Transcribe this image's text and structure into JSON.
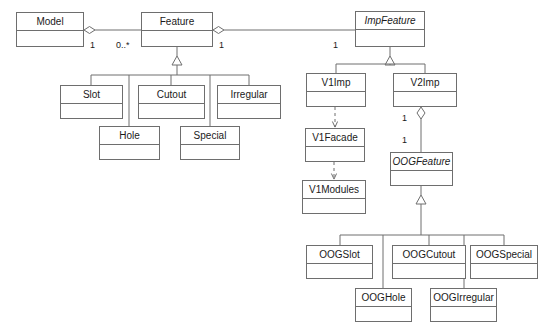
{
  "diagram": {
    "type": "uml-class-diagram",
    "background_color": "#ffffff",
    "line_color": "#6e6e6e",
    "text_color": "#1a1a1a",
    "classes": [
      {
        "id": "model",
        "name": "Model",
        "abstract": false,
        "x": 16,
        "y": 12,
        "w": 68,
        "h": 35
      },
      {
        "id": "feature",
        "name": "Feature",
        "abstract": false,
        "x": 141,
        "y": 12,
        "w": 72,
        "h": 35
      },
      {
        "id": "impfeature",
        "name": "ImpFeature",
        "abstract": true,
        "x": 355,
        "y": 11,
        "w": 70,
        "h": 36
      },
      {
        "id": "slot",
        "name": "Slot",
        "abstract": false,
        "x": 60,
        "y": 85,
        "w": 63,
        "h": 34
      },
      {
        "id": "cutout",
        "name": "Cutout",
        "abstract": false,
        "x": 138,
        "y": 85,
        "w": 67,
        "h": 34
      },
      {
        "id": "irregular",
        "name": "Irregular",
        "abstract": false,
        "x": 217,
        "y": 85,
        "w": 64,
        "h": 34
      },
      {
        "id": "hole",
        "name": "Hole",
        "abstract": false,
        "x": 99,
        "y": 126,
        "w": 61,
        "h": 34
      },
      {
        "id": "special",
        "name": "Special",
        "abstract": false,
        "x": 180,
        "y": 126,
        "w": 60,
        "h": 34
      },
      {
        "id": "v1imp",
        "name": "V1Imp",
        "abstract": false,
        "x": 306,
        "y": 73,
        "w": 60,
        "h": 34
      },
      {
        "id": "v2imp",
        "name": "V2Imp",
        "abstract": false,
        "x": 393,
        "y": 73,
        "w": 64,
        "h": 34
      },
      {
        "id": "v1facade",
        "name": "V1Facade",
        "abstract": false,
        "x": 305,
        "y": 128,
        "w": 60,
        "h": 34
      },
      {
        "id": "v1modules",
        "name": "V1Modules",
        "abstract": false,
        "x": 302,
        "y": 180,
        "w": 64,
        "h": 34
      },
      {
        "id": "oogfeature",
        "name": "OOGFeature",
        "abstract": true,
        "x": 390,
        "y": 152,
        "w": 63,
        "h": 34
      },
      {
        "id": "oogslot",
        "name": "OOGSlot",
        "abstract": false,
        "x": 306,
        "y": 245,
        "w": 67,
        "h": 34
      },
      {
        "id": "oogcutout",
        "name": "OOGCutout",
        "abstract": false,
        "x": 392,
        "y": 245,
        "w": 74,
        "h": 34
      },
      {
        "id": "oogspecial",
        "name": "OOGSpecial",
        "abstract": false,
        "x": 470,
        "y": 245,
        "w": 68,
        "h": 34
      },
      {
        "id": "oophole",
        "name": "OOGHole",
        "abstract": false,
        "x": 355,
        "y": 288,
        "w": 57,
        "h": 34
      },
      {
        "id": "oogirregular",
        "name": "OOGIrregular",
        "abstract": false,
        "x": 430,
        "y": 288,
        "w": 67,
        "h": 34
      }
    ],
    "multiplicities": [
      {
        "id": "m-model-feature-src",
        "text": "1",
        "x": 90,
        "y": 40
      },
      {
        "id": "m-model-feature-tgt",
        "text": "0..*",
        "x": 116,
        "y": 40
      },
      {
        "id": "m-feature-imp-src",
        "text": "1",
        "x": 219,
        "y": 40
      },
      {
        "id": "m-feature-imp-tgt",
        "text": "1",
        "x": 333,
        "y": 40
      },
      {
        "id": "m-v2imp-oog-src",
        "text": "1",
        "x": 402,
        "y": 113
      },
      {
        "id": "m-v2imp-oog-tgt",
        "text": "1",
        "x": 402,
        "y": 135
      }
    ],
    "relationships": [
      {
        "id": "r-model-feature",
        "type": "aggregation",
        "from": "model",
        "to": "feature"
      },
      {
        "id": "r-feature-imp",
        "type": "aggregation",
        "from": "feature",
        "to": "impfeature"
      },
      {
        "id": "r-v2imp-oog",
        "type": "aggregation",
        "from": "v2imp",
        "to": "oogfeature"
      },
      {
        "id": "r-slot-feature",
        "type": "generalization",
        "from": "slot",
        "to": "feature"
      },
      {
        "id": "r-cutout-feature",
        "type": "generalization",
        "from": "cutout",
        "to": "feature"
      },
      {
        "id": "r-irregular-feature",
        "type": "generalization",
        "from": "irregular",
        "to": "feature"
      },
      {
        "id": "r-hole-feature",
        "type": "generalization",
        "from": "hole",
        "to": "feature"
      },
      {
        "id": "r-special-feature",
        "type": "generalization",
        "from": "special",
        "to": "feature"
      },
      {
        "id": "r-v1imp-imp",
        "type": "generalization",
        "from": "v1imp",
        "to": "impfeature"
      },
      {
        "id": "r-v2imp-imp",
        "type": "generalization",
        "from": "v2imp",
        "to": "impfeature"
      },
      {
        "id": "r-oogslot-oog",
        "type": "generalization",
        "from": "oogslot",
        "to": "oogfeature"
      },
      {
        "id": "r-oogcutout-oog",
        "type": "generalization",
        "from": "oogcutout",
        "to": "oogfeature"
      },
      {
        "id": "r-oogspecial-oog",
        "type": "generalization",
        "from": "oogspecial",
        "to": "oogfeature"
      },
      {
        "id": "r-ooghole-oog",
        "type": "generalization",
        "from": "ooghole",
        "to": "oogfeature"
      },
      {
        "id": "r-oogirregular-oog",
        "type": "generalization",
        "from": "oogirregular",
        "to": "oogfeature"
      },
      {
        "id": "r-v1imp-v1facade",
        "type": "dependency",
        "from": "v1imp",
        "to": "v1facade"
      },
      {
        "id": "r-v1facade-v1modules",
        "type": "dependency",
        "from": "v1facade",
        "to": "v1modules"
      }
    ]
  }
}
